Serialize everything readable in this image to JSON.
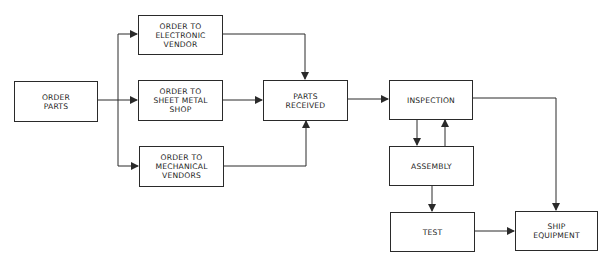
{
  "diagram": {
    "type": "flowchart",
    "nodes": {
      "order_parts": "ORDER\nPARTS",
      "order_electronic": "ORDER TO\nELECTRONIC\nVENDOR",
      "order_sheet_metal": "ORDER TO\nSHEET METAL\nSHOP",
      "order_mechanical": "ORDER TO\nMECHANICAL\nVENDORS",
      "parts_received": "PARTS\nRECEIVED",
      "inspection": "INSPECTION",
      "assembly": "ASSEMBLY",
      "test": "TEST",
      "ship_equipment": "SHIP\nEQUIPMENT"
    },
    "edges": [
      {
        "from": "order_parts",
        "to": "order_electronic"
      },
      {
        "from": "order_parts",
        "to": "order_sheet_metal"
      },
      {
        "from": "order_parts",
        "to": "order_mechanical"
      },
      {
        "from": "order_electronic",
        "to": "parts_received"
      },
      {
        "from": "order_sheet_metal",
        "to": "parts_received"
      },
      {
        "from": "order_mechanical",
        "to": "parts_received"
      },
      {
        "from": "parts_received",
        "to": "inspection"
      },
      {
        "from": "inspection",
        "to": "assembly"
      },
      {
        "from": "assembly",
        "to": "inspection"
      },
      {
        "from": "assembly",
        "to": "test"
      },
      {
        "from": "test",
        "to": "ship_equipment"
      },
      {
        "from": "inspection",
        "to": "ship_equipment"
      }
    ],
    "colors": {
      "line": "#2a2a2a",
      "background": "#ffffff"
    }
  }
}
